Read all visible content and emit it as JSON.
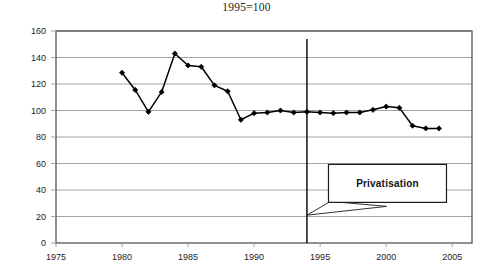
{
  "chart_data": {
    "type": "line",
    "title": "1995=100",
    "xlabel": "",
    "ylabel": "",
    "xlim": [
      1975,
      2006.5
    ],
    "ylim": [
      0,
      160
    ],
    "x_ticks": [
      1975,
      1980,
      1985,
      1990,
      1995,
      2000,
      2005
    ],
    "y_ticks": [
      0,
      20,
      40,
      60,
      80,
      100,
      120,
      140,
      160
    ],
    "grid": "horizontal",
    "legend": null,
    "series": [
      {
        "name": "index",
        "marker": "diamond",
        "color": "#000000",
        "x": [
          1980,
          1981,
          1982,
          1983,
          1984,
          1985,
          1986,
          1987,
          1988,
          1989,
          1990,
          1991,
          1992,
          1993,
          1994,
          1995,
          1996,
          1997,
          1998,
          1999,
          2000,
          2001,
          2002,
          2003,
          2004
        ],
        "values": [
          128.5,
          115.5,
          99.0,
          114.0,
          143.0,
          134.0,
          133.0,
          119.0,
          114.5,
          93.0,
          98.0,
          98.5,
          100.0,
          98.5,
          99.0,
          98.5,
          98.0,
          98.5,
          98.5,
          100.5,
          103.0,
          102.0,
          88.5,
          86.5,
          86.5
        ]
      }
    ],
    "annotations": [
      {
        "name": "privatisation-marker",
        "type": "vertical-line",
        "x": 1994,
        "y_from": 0,
        "y_to": 154
      },
      {
        "name": "privatisation-callout",
        "type": "callout-box",
        "text": "Privatisation",
        "x": 2000.1,
        "y": 45,
        "pointer_x": 1994,
        "pointer_y": 21
      }
    ]
  },
  "axis": {
    "y_tick_labels": [
      "160",
      "140",
      "120",
      "100",
      "80",
      "60",
      "40",
      "20",
      "0"
    ],
    "x_tick_labels": [
      "1975",
      "1980",
      "1985",
      "1990",
      "1995",
      "2000",
      "2005"
    ]
  },
  "colors": {
    "line": "#000000",
    "marker": "#000000",
    "grid": "#9a9a9a",
    "frame": "#555555",
    "text": "#232323",
    "background": "#ffffff"
  }
}
